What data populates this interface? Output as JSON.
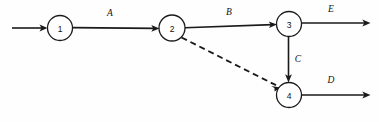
{
  "diagram": {
    "type": "activity-on-arrow-network",
    "canvas": {
      "width": 379,
      "height": 122
    },
    "background_color": "#fefefe",
    "line_color": "#1a1a1a",
    "nodes": [
      {
        "id": "1",
        "label": "1",
        "cx": 60,
        "cy": 28,
        "r": 12.5
      },
      {
        "id": "2",
        "label": "2",
        "cx": 172,
        "cy": 28,
        "r": 13
      },
      {
        "id": "3",
        "label": "3",
        "cx": 289,
        "cy": 24,
        "r": 12.5
      },
      {
        "id": "4",
        "label": "4",
        "cx": 289,
        "cy": 95,
        "r": 12.5
      }
    ],
    "edges": [
      {
        "id": "start-to-1",
        "label": "",
        "style": "solid",
        "from": "start",
        "to": "1",
        "x1": 12,
        "y1": 28,
        "x2": 47.5,
        "y2": 28,
        "arrow": true
      },
      {
        "id": "edge-A",
        "label": "A",
        "style": "solid",
        "from": "1",
        "to": "2",
        "x1": 72.5,
        "y1": 27.6,
        "x2": 159,
        "y2": 28.4,
        "arrow": true,
        "label_x": 110,
        "label_y": 13
      },
      {
        "id": "edge-B",
        "label": "B",
        "style": "solid",
        "from": "2",
        "to": "3",
        "x1": 185,
        "y1": 27.6,
        "x2": 276.5,
        "y2": 24.4,
        "arrow": true,
        "label_x": 229,
        "label_y": 12
      },
      {
        "id": "edge-E",
        "label": "E",
        "style": "solid",
        "from": "3",
        "to": "end",
        "x1": 301.5,
        "y1": 23,
        "x2": 370,
        "y2": 23,
        "arrow": true,
        "label_x": 331,
        "label_y": 9
      },
      {
        "id": "edge-C",
        "label": "C",
        "style": "solid",
        "from": "3",
        "to": "4",
        "x1": 288.5,
        "y1": 36.5,
        "x2": 288.5,
        "y2": 82,
        "arrow": true,
        "label_x": 298,
        "label_y": 59
      },
      {
        "id": "edge-dummy",
        "label": "",
        "style": "dashed",
        "from": "2",
        "to": "4",
        "x1": 181.5,
        "y1": 37.5,
        "x2": 279.5,
        "y2": 87,
        "arrow": true
      },
      {
        "id": "edge-D",
        "label": "D",
        "style": "solid",
        "from": "4",
        "to": "end",
        "x1": 301.5,
        "y1": 95,
        "x2": 370,
        "y2": 95,
        "arrow": true,
        "label_x": 331,
        "label_y": 80
      }
    ]
  }
}
